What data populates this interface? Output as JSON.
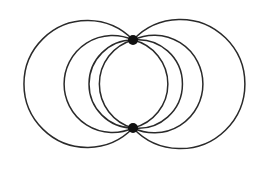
{
  "diagram": {
    "stroke_color": "#2a2a2a",
    "node_color": "#111111",
    "nodes": [
      {
        "id": "top-node",
        "x": 133,
        "y": 40,
        "r": 5
      },
      {
        "id": "bottom-node",
        "x": 133,
        "y": 128,
        "r": 5
      }
    ],
    "arcs": [
      {
        "side": "left",
        "extreme_x": 24,
        "radius": 63.4,
        "large": 1
      },
      {
        "side": "left",
        "extreme_x": 64,
        "radius": 48.5,
        "large": 1
      },
      {
        "side": "left",
        "extreme_x": 87,
        "radius": 44.0,
        "large": 1
      },
      {
        "side": "left",
        "extreme_x": 99.5,
        "radius": 45.6,
        "large": 0
      },
      {
        "side": "right",
        "extreme_x": 168,
        "radius": 45.2,
        "large": 0
      },
      {
        "side": "right",
        "extreme_x": 182,
        "radius": 44.3,
        "large": 1
      },
      {
        "side": "right",
        "extreme_x": 203,
        "radius": 48.8,
        "large": 1
      },
      {
        "side": "right",
        "extreme_x": 245,
        "radius": 64.6,
        "large": 1
      }
    ]
  }
}
